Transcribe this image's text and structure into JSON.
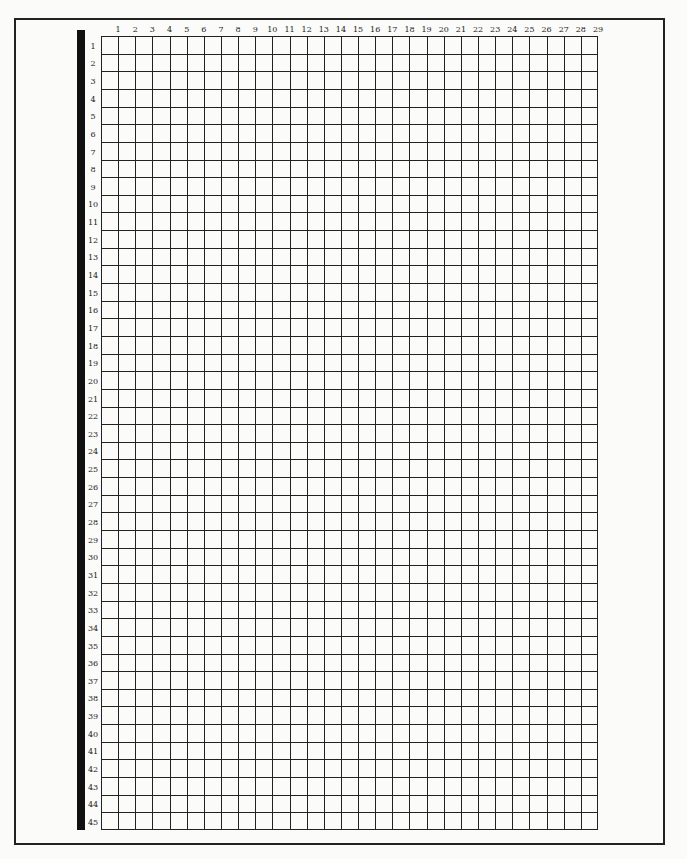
{
  "page": {
    "type": "blank numbered grid worksheet",
    "columns": [
      "1",
      "2",
      "3",
      "4",
      "5",
      "6",
      "7",
      "8",
      "9",
      "10",
      "11",
      "12",
      "13",
      "14",
      "15",
      "16",
      "17",
      "18",
      "19",
      "20",
      "21",
      "22",
      "23",
      "24",
      "25",
      "26",
      "27",
      "28",
      "29"
    ],
    "rows": [
      "1",
      "2",
      "3",
      "4",
      "5",
      "6",
      "7",
      "8",
      "9",
      "10",
      "11",
      "12",
      "13",
      "14",
      "15",
      "16",
      "17",
      "18",
      "19",
      "20",
      "21",
      "22",
      "23",
      "24",
      "25",
      "26",
      "27",
      "28",
      "29",
      "30",
      "31",
      "32",
      "33",
      "34",
      "35",
      "36",
      "37",
      "38",
      "39",
      "40",
      "41",
      "42",
      "43",
      "44",
      "45"
    ],
    "colors": {
      "line": "#222222",
      "bar": "#111111",
      "paper": "#fbfbfa"
    }
  }
}
